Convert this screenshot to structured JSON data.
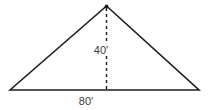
{
  "diagram": {
    "kind": "triangle-dimension-diagram",
    "shape": "isosceles triangle with dashed altitude from apex to base",
    "height_label": "40′",
    "base_label": "80′",
    "height_value_ft": 40,
    "base_value_ft": 80,
    "line_color": "#1c1c1c",
    "label_color": "#3d3d3d",
    "background_color": "#ffffff"
  }
}
